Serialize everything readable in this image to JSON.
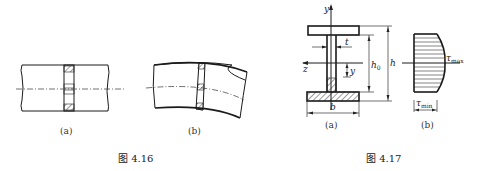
{
  "figure_4_16": {
    "caption": "图 4.16",
    "subfigures": [
      {
        "label": "(a)",
        "description": "straight beam segment with hatched cross-section strip"
      },
      {
        "label": "(b)",
        "description": "bent beam segment with distorted cross-section strip"
      }
    ]
  },
  "figure_4_17": {
    "caption": "图 4.17",
    "subfigures": [
      {
        "label": "(a)",
        "description": "I-beam cross-section"
      },
      {
        "label": "(b)",
        "description": "shear stress distribution in web"
      }
    ],
    "labels": {
      "y_axis": "y",
      "z_axis": "z",
      "thickness": "t",
      "y_dist": "y",
      "h0": "h",
      "h0_sub": "0",
      "h": "h",
      "b": "b",
      "tau_max": "τ",
      "tau_max_sub": "max",
      "tau_min": "τ",
      "tau_min_sub": "min"
    }
  }
}
